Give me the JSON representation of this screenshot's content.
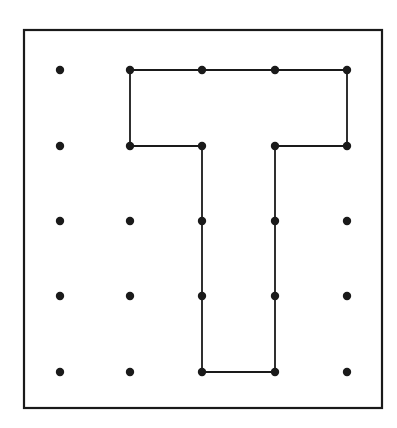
{
  "figure": {
    "colors": {
      "background": "#ffffff",
      "ink": "#1a1a1a"
    },
    "frame": {
      "x": 24,
      "y": 30,
      "width": 358,
      "height": 378
    },
    "grid": {
      "columns_x": [
        60,
        130,
        202,
        275,
        347
      ],
      "rows_y": [
        70,
        146,
        221,
        296,
        372
      ],
      "dot_radius": 4.2
    },
    "shape": {
      "name": "letter-T",
      "vertices": [
        [
          1,
          0
        ],
        [
          4,
          0
        ],
        [
          4,
          1
        ],
        [
          3,
          1
        ],
        [
          3,
          4
        ],
        [
          2,
          4
        ],
        [
          2,
          1
        ],
        [
          1,
          1
        ]
      ],
      "intermediate_dots_on_path": [
        [
          2,
          0
        ],
        [
          3,
          0
        ],
        [
          2,
          2
        ],
        [
          2,
          3
        ],
        [
          3,
          2
        ],
        [
          3,
          3
        ]
      ]
    }
  }
}
